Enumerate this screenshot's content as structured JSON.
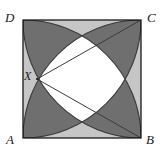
{
  "figure": {
    "type": "geometry-diagram",
    "background_color": "#ffffff",
    "square": {
      "name": "ABCD",
      "left": 23,
      "top": 20,
      "size": 118,
      "stroke_color": "#1a1a1a",
      "stroke_width": 1.1
    },
    "labels": {
      "A": "A",
      "B": "B",
      "C": "C",
      "D": "D",
      "X": "X"
    },
    "vertices": {
      "A": {
        "x": 23,
        "y": 138
      },
      "B": {
        "x": 141,
        "y": 138
      },
      "C": {
        "x": 141,
        "y": 20
      },
      "D": {
        "x": 23,
        "y": 20
      },
      "X": {
        "x": 37,
        "y": 79
      }
    },
    "colors": {
      "light_gray": "#c6c6c6",
      "mid_gray": "#a8a8a8",
      "dark_gray": "#767676",
      "darkest_gray": "#6a6a6a",
      "white": "#ffffff",
      "ink": "#1a1a1a"
    },
    "arcs": [
      {
        "name": "arc-centred-at-A",
        "center": "A",
        "radius": 118
      },
      {
        "name": "arc-centred-at-B",
        "center": "B",
        "radius": 118
      },
      {
        "name": "arc-centred-at-C",
        "center": "C",
        "radius": 118
      },
      {
        "name": "arc-centred-at-D",
        "center": "D",
        "radius": 118
      }
    ],
    "segments": [
      {
        "name": "segment-X-to-C",
        "from": "X",
        "to": "C"
      },
      {
        "name": "segment-X-to-B",
        "from": "X",
        "to": "B"
      }
    ],
    "region_shading": {
      "corner_top_left": "#c6c6c6",
      "corner_top_right": "#767676",
      "corner_bottom_left": "#767676",
      "corner_bottom_right": "#c6c6c6",
      "center": "#ffffff"
    }
  }
}
